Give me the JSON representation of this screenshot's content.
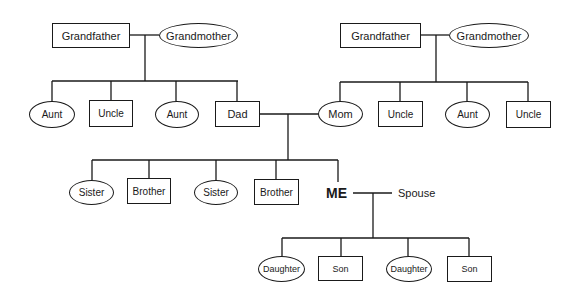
{
  "diagram": {
    "type": "family-tree",
    "line_color": "#1a1a1a",
    "paternal": {
      "grandfather": "Grandfather",
      "grandmother": "Grandmother",
      "children": [
        "Aunt",
        "Uncle",
        "Aunt",
        "Dad"
      ]
    },
    "maternal": {
      "grandfather": "Grandfather",
      "grandmother": "Grandmother",
      "children": [
        "Mom",
        "Uncle",
        "Aunt",
        "Uncle"
      ]
    },
    "siblings": [
      "Sister",
      "Brother",
      "Sister",
      "Brother"
    ],
    "self": "ME",
    "spouse": "Spouse",
    "children": [
      "Daughter",
      "Son",
      "Daughter",
      "Son"
    ]
  }
}
